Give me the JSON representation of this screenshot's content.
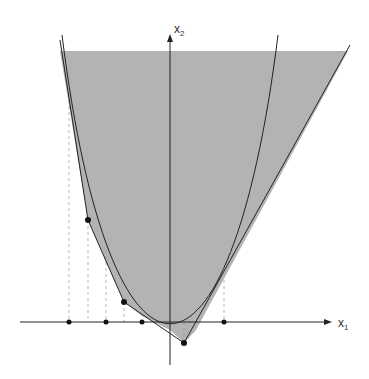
{
  "axes": {
    "x_label": "x",
    "x_sub": "1",
    "y_label": "x",
    "y_sub": "2"
  },
  "colors": {
    "shade": "#b3b3b3",
    "line": "#222222",
    "dash": "#999999"
  },
  "points": {
    "on_axis": [
      69,
      106,
      142,
      224
    ],
    "off_axis": [
      [
        88,
        220
      ],
      [
        124,
        302
      ],
      [
        184,
        343
      ]
    ]
  }
}
